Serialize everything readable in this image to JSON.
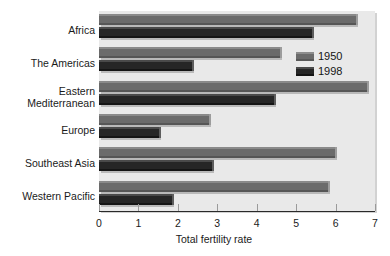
{
  "chart_data": {
    "type": "bar",
    "orientation": "horizontal",
    "title": "",
    "xlabel": "Total fertility rate",
    "ylabel": "",
    "xlim": [
      0,
      7
    ],
    "xticks": [
      0,
      1,
      2,
      3,
      4,
      5,
      6,
      7
    ],
    "xtick_labels": [
      "0",
      "1",
      "2",
      "3",
      "4",
      "5",
      "6",
      "7"
    ],
    "grid": false,
    "legend_position": "upper right",
    "categories": [
      "Africa",
      "The Americas",
      "Eastern\nMediterranean",
      "Europe",
      "Southeast Asia",
      "Western Pacific"
    ],
    "series": [
      {
        "name": "1950",
        "color": "#6b6b6b",
        "values": [
          6.53,
          4.6,
          6.8,
          2.78,
          5.98,
          5.8
        ]
      },
      {
        "name": "1998",
        "color": "#262626",
        "values": [
          5.4,
          2.35,
          4.45,
          1.52,
          2.87,
          1.85
        ]
      }
    ]
  },
  "legend": {
    "entries": [
      {
        "label": "1950"
      },
      {
        "label": "1998"
      }
    ]
  },
  "axis": {
    "x_title": "Total fertility rate"
  },
  "colors": {
    "plot_background": "#e9e9e9",
    "series_1950": "#6b6b6b",
    "series_1998": "#262626",
    "axis": "#2a2a2a"
  }
}
